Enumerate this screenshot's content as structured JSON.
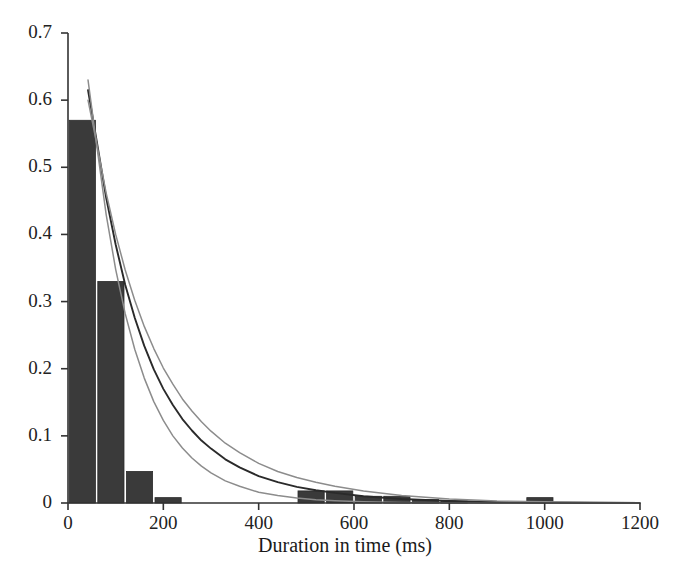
{
  "chart_data": {
    "type": "bar",
    "title": "",
    "xlabel": "Duration in time (ms)",
    "ylabel": "",
    "xlim": [
      0,
      1200
    ],
    "ylim": [
      0,
      0.7
    ],
    "xticks": [
      0,
      200,
      400,
      600,
      800,
      1000,
      1200
    ],
    "xtick_labels": [
      "0",
      "200",
      "400",
      "600",
      "800",
      "1000",
      "1200"
    ],
    "yticks": [
      0,
      0.1,
      0.2,
      0.3,
      0.4,
      0.5,
      0.6,
      0.7
    ],
    "ytick_labels": [
      "0",
      "0.1",
      "0.2",
      "0.3",
      "0.4",
      "0.5",
      "0.6",
      "0.7"
    ],
    "grid": false,
    "legend": "none",
    "bin_width": 60,
    "bar_color": "#3a3a3a",
    "histogram": {
      "name": "Duration histogram (relative frequency)",
      "bin_starts": [
        0,
        60,
        120,
        180,
        240,
        300,
        360,
        420,
        480,
        540,
        600,
        660,
        720,
        780,
        840,
        900,
        960,
        1020,
        1080,
        1140
      ],
      "values": [
        0.57,
        0.33,
        0.047,
        0.008,
        0.0,
        0.0,
        0.0,
        0.0,
        0.018,
        0.018,
        0.01,
        0.01,
        0.005,
        0.003,
        0.0,
        0.0,
        0.008,
        0.0,
        0.0,
        0.0
      ]
    },
    "series": [
      {
        "name": "Fitted exponential density",
        "color": "#2a2a2a",
        "type": "line",
        "x": [
          42,
          60,
          80,
          100,
          120,
          140,
          160,
          180,
          200,
          220,
          240,
          260,
          280,
          300,
          330,
          360,
          400,
          440,
          480,
          520,
          560,
          620,
          700,
          800,
          900,
          1000,
          1100,
          1200
        ],
        "y": [
          0.615,
          0.54,
          0.455,
          0.385,
          0.325,
          0.276,
          0.234,
          0.199,
          0.17,
          0.146,
          0.125,
          0.108,
          0.093,
          0.081,
          0.065,
          0.053,
          0.04,
          0.031,
          0.024,
          0.019,
          0.015,
          0.01,
          0.006,
          0.003,
          0.0015,
          0.0008,
          0.0004,
          0.0002
        ]
      },
      {
        "name": "Upper confidence band",
        "color": "#8c8c8c",
        "type": "line",
        "x": [
          42,
          60,
          80,
          100,
          120,
          140,
          160,
          180,
          200,
          220,
          240,
          260,
          280,
          300,
          330,
          360,
          400,
          440,
          480,
          520,
          560,
          620,
          700,
          800,
          900,
          1000,
          1100,
          1200
        ],
        "y": [
          0.6,
          0.536,
          0.462,
          0.4,
          0.347,
          0.302,
          0.263,
          0.23,
          0.201,
          0.177,
          0.155,
          0.137,
          0.121,
          0.107,
          0.089,
          0.075,
          0.059,
          0.047,
          0.038,
          0.031,
          0.025,
          0.018,
          0.011,
          0.006,
          0.003,
          0.0017,
          0.0009,
          0.0005
        ]
      },
      {
        "name": "Lower confidence band",
        "color": "#8c8c8c",
        "type": "line",
        "x": [
          42,
          60,
          80,
          100,
          120,
          140,
          160,
          180,
          200,
          220,
          240,
          260,
          280,
          300,
          330,
          360,
          400,
          440,
          480,
          520,
          560,
          620,
          700,
          800,
          900,
          1000,
          1100,
          1200
        ],
        "y": [
          0.63,
          0.534,
          0.43,
          0.348,
          0.282,
          0.229,
          0.186,
          0.151,
          0.123,
          0.1,
          0.082,
          0.067,
          0.055,
          0.045,
          0.033,
          0.025,
          0.016,
          0.011,
          0.0073,
          0.005,
          0.0034,
          0.0019,
          0.0009,
          0.0003,
          0.0001,
          5e-05,
          2e-05,
          1e-05
        ]
      }
    ]
  }
}
